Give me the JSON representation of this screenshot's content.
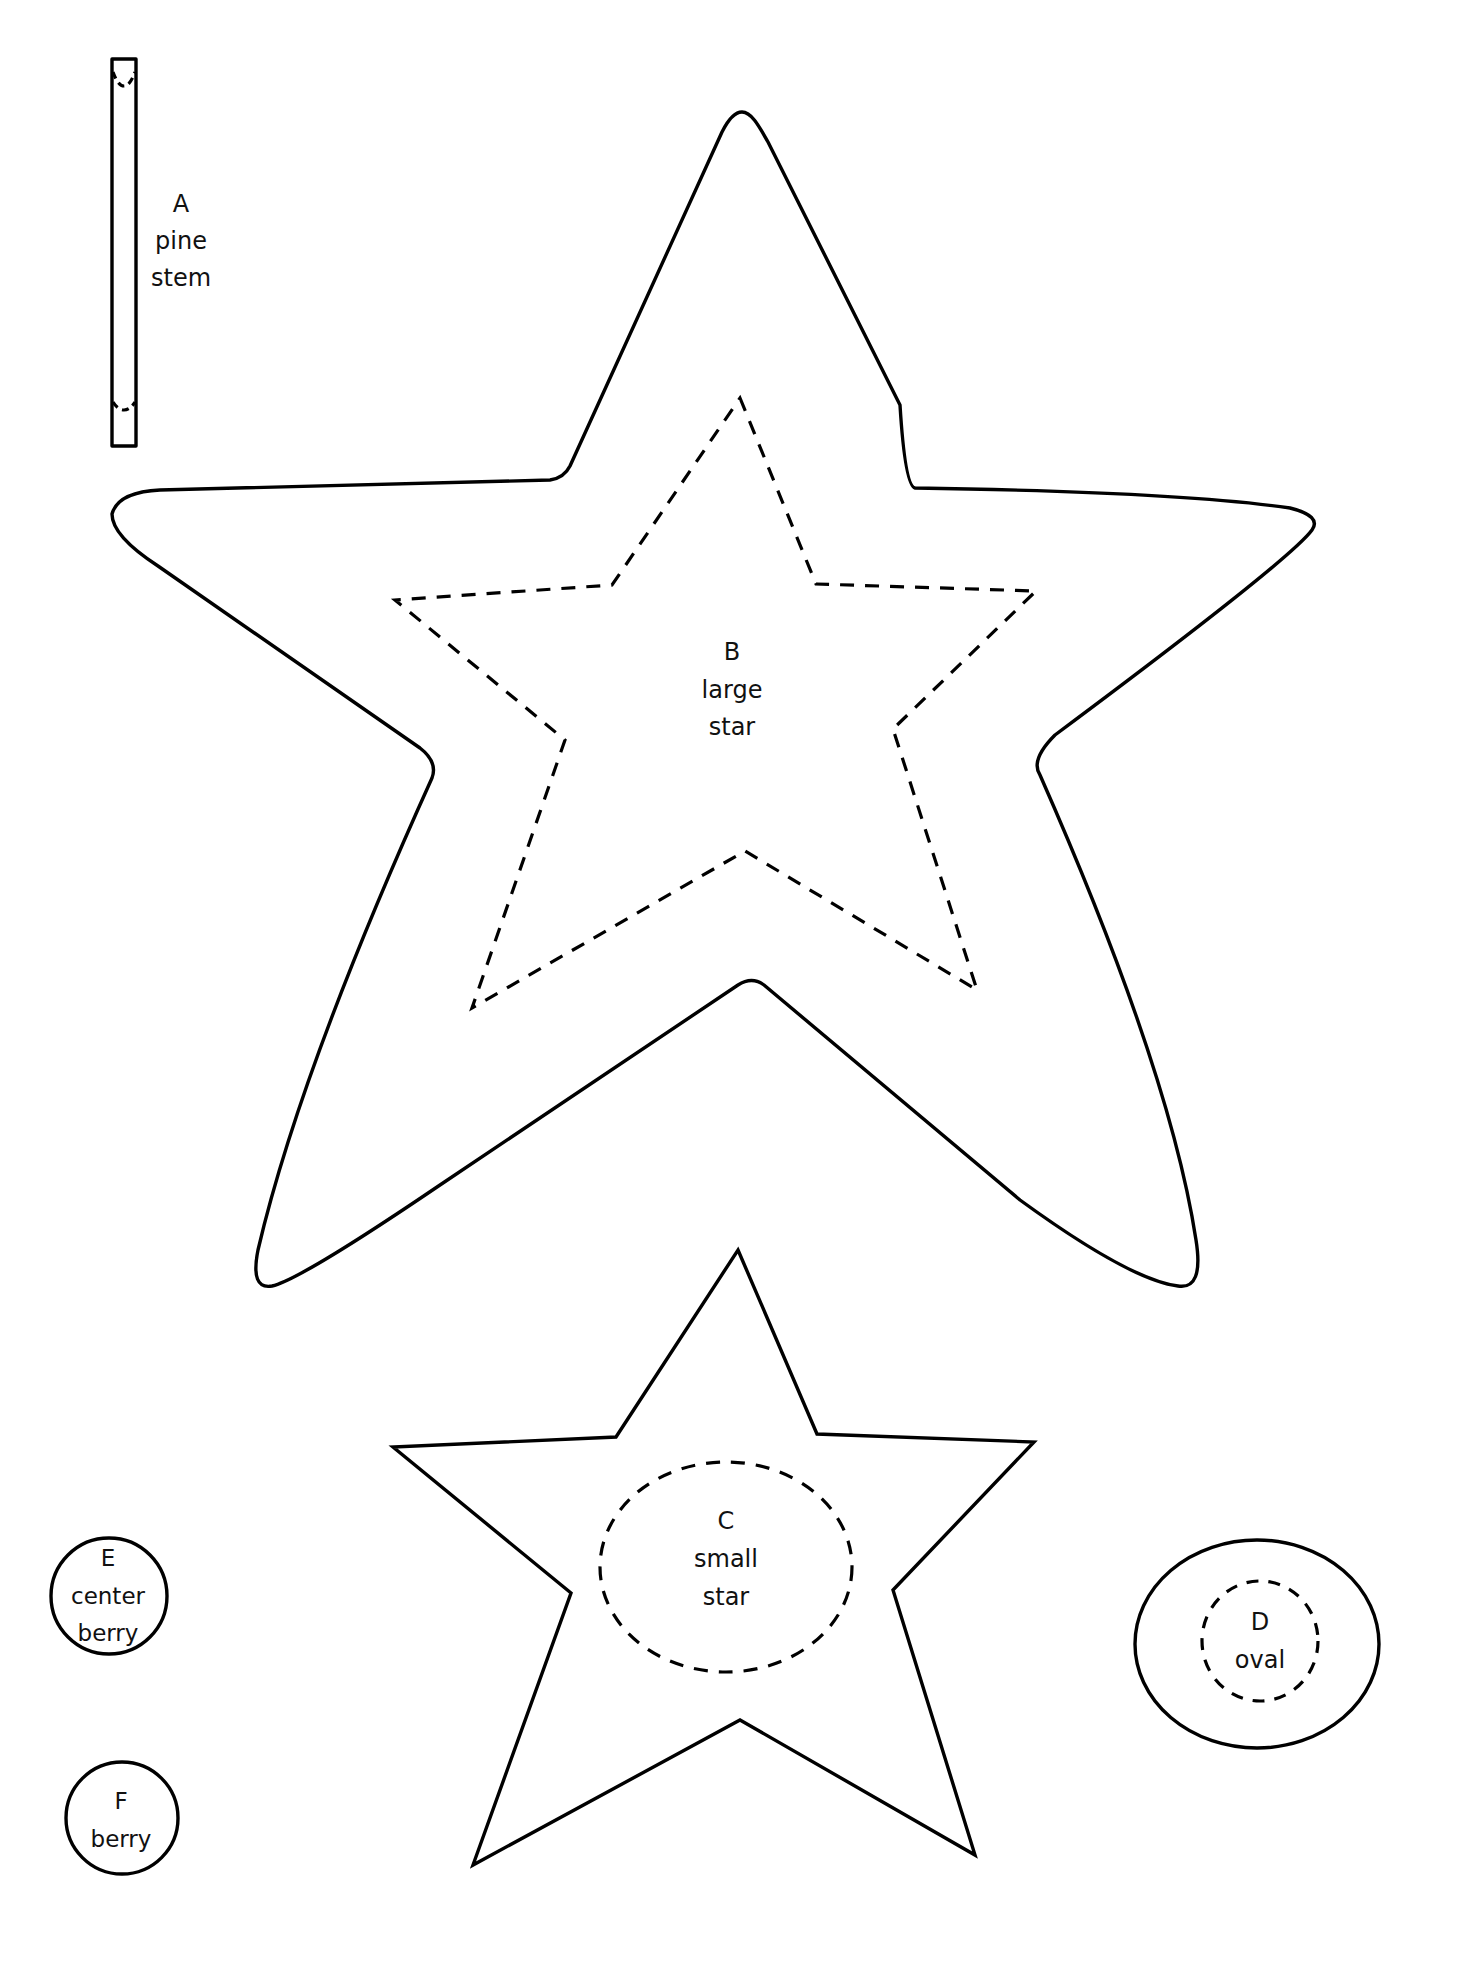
{
  "page": {
    "background": "#ffffff",
    "line_color": "#000000"
  },
  "pieces": {
    "A": {
      "letter": "A",
      "line1": "pine",
      "line2": "stem"
    },
    "B": {
      "letter": "B",
      "line1": "large",
      "line2": "star"
    },
    "C": {
      "letter": "C",
      "line1": "small",
      "line2": "star"
    },
    "D": {
      "letter": "D",
      "line1": "oval"
    },
    "E": {
      "letter": "E",
      "line1": "center",
      "line2": "berry"
    },
    "F": {
      "letter": "F",
      "line1": "berry"
    }
  }
}
